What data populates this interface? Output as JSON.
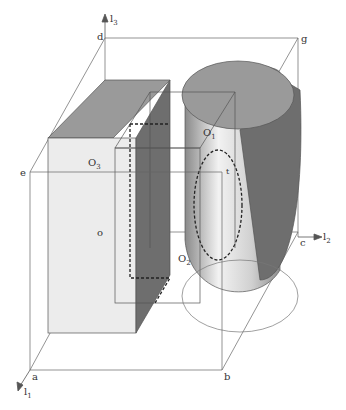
{
  "diagram": {
    "type": "3d-geometric-composition",
    "axes": [
      {
        "name": "l1",
        "base": "l",
        "sub": "1"
      },
      {
        "name": "l2",
        "base": "l",
        "sub": "2"
      },
      {
        "name": "l3",
        "base": "l",
        "sub": "3"
      }
    ],
    "vertices": {
      "a": "a",
      "b": "b",
      "c": "c",
      "d": "d",
      "e": "e",
      "g": "g",
      "o": "o"
    },
    "objects": [
      {
        "name": "O1",
        "base": "O",
        "sub": "1",
        "shape": "cylinder"
      },
      {
        "name": "O2",
        "base": "O",
        "sub": "2",
        "shape": "box"
      },
      {
        "name": "O3",
        "base": "O",
        "sub": "3",
        "shape": "box"
      }
    ],
    "marker": "t",
    "colors": {
      "line": "#555555",
      "dark": "#6e6e6e",
      "mid": "#9a9a9a",
      "light": "#ececec"
    }
  }
}
